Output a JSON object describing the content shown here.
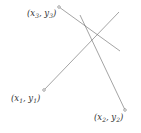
{
  "diagram": {
    "type": "line-segment-intersection",
    "line_color": "#555555",
    "marker_color": "#555555",
    "points": [
      {
        "id": "p1",
        "label": "x",
        "sub": "1",
        "label2": "y",
        "sub2": "1",
        "x": 44,
        "y": 90
      },
      {
        "id": "p2",
        "label": "x",
        "sub": "2",
        "label2": "y",
        "sub2": "2",
        "x": 125,
        "y": 110
      },
      {
        "id": "p3",
        "label": "x",
        "sub": "3",
        "label2": "y",
        "sub2": "3",
        "x": 59,
        "y": 7
      }
    ],
    "labels": {
      "p1_text": "(x1, y1)",
      "p2_text": "(x2, y2)",
      "p3_text": "(x3, y3)"
    },
    "segments": [
      {
        "from": [
          44,
          90
        ],
        "to": [
          119,
          12
        ],
        "desc": "segment from (x1,y1) toward upper right"
      },
      {
        "from": [
          80,
          15
        ],
        "to": [
          125,
          110
        ],
        "desc": "segment ending at (x2,y2)"
      },
      {
        "from": [
          59,
          7
        ],
        "to": [
          120,
          51
        ],
        "desc": "segment starting at (x3,y3)"
      }
    ]
  }
}
